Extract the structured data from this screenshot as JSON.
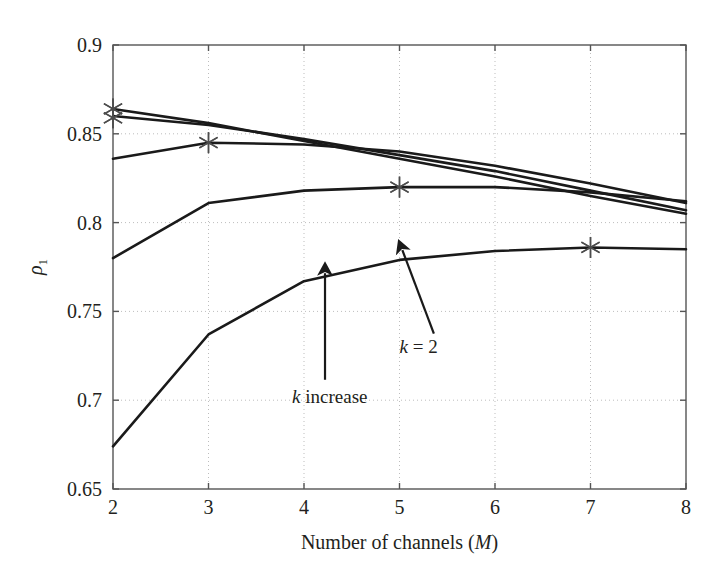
{
  "chart_data": {
    "type": "line",
    "title": "",
    "subtitle": "",
    "xlabel": "Number of channels (M)",
    "xlabel_plain": "Number of channels",
    "xlabel_symbol": "M",
    "ylabel": "ρ₁",
    "ylabel_symbol": "ρ",
    "ylabel_subscript": "1",
    "xlim": [
      2,
      8
    ],
    "ylim": [
      0.65,
      0.9
    ],
    "xticks": [
      2,
      3,
      4,
      5,
      6,
      7,
      8
    ],
    "xtick_labels": [
      "2",
      "3",
      "4",
      "5",
      "6",
      "7",
      "8"
    ],
    "yticks": [
      0.65,
      0.7,
      0.75,
      0.8,
      0.85,
      0.9
    ],
    "ytick_labels": [
      "0.65",
      "0.7",
      "0.75",
      "0.8",
      "0.85",
      "0.9"
    ],
    "grid": true,
    "grid_style": "dotted",
    "grid_color": "#bdbdbd",
    "legend": null,
    "legend_position": "none",
    "line_color": "#1a1a1a",
    "marker_symbol": "*",
    "marker_color": "#4d4d4d",
    "background_color": "#ffffff",
    "axes_color": "#555555",
    "x": [
      2,
      3,
      4,
      5,
      6,
      7,
      8
    ],
    "series": [
      {
        "name": "k = 2",
        "marker_at_x": 7,
        "marker_value": 0.786,
        "values": [
          0.674,
          0.737,
          0.767,
          0.779,
          0.784,
          0.786,
          0.785
        ]
      },
      {
        "name": "k = 3",
        "marker_at_x": 5,
        "marker_value": 0.82,
        "values": [
          0.78,
          0.811,
          0.818,
          0.82,
          0.82,
          0.817,
          0.812
        ]
      },
      {
        "name": "k = 4",
        "marker_at_x": 3,
        "marker_value": 0.845,
        "values": [
          0.836,
          0.845,
          0.844,
          0.84,
          0.832,
          0.822,
          0.811
        ]
      },
      {
        "name": "k = 5",
        "marker_at_x": 2,
        "marker_value": 0.86,
        "values": [
          0.86,
          0.855,
          0.847,
          0.838,
          0.829,
          0.818,
          0.807
        ]
      },
      {
        "name": "k = 6",
        "marker_at_x": 2,
        "marker_value": 0.864,
        "values": [
          0.864,
          0.856,
          0.846,
          0.836,
          0.826,
          0.815,
          0.805
        ]
      }
    ],
    "markers": [
      {
        "x": 2,
        "y": 0.864
      },
      {
        "x": 2,
        "y": 0.859
      },
      {
        "x": 3,
        "y": 0.845
      },
      {
        "x": 5,
        "y": 0.82
      },
      {
        "x": 7,
        "y": 0.786
      }
    ],
    "annotations": [
      {
        "id": "k-increase",
        "text": "k increase",
        "symbol": "k",
        "rest": " increase",
        "label_x": 4.27,
        "label_y": 0.6985,
        "arrow_from": [
          4.22,
          0.7115
        ],
        "arrow_to": [
          4.22,
          0.7715
        ]
      },
      {
        "id": "k-equals-2",
        "text": "k = 2",
        "symbol": "k",
        "rest": " = 2",
        "label_x": 5.2,
        "label_y": 0.7265,
        "arrow_from": [
          5.36,
          0.7375
        ],
        "arrow_to": [
          5.03,
          0.7845
        ]
      }
    ]
  }
}
